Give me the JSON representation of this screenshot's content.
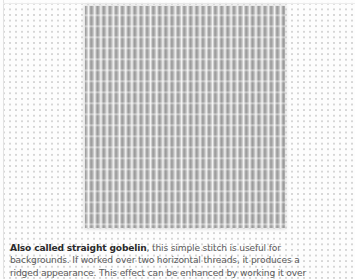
{
  "figure": {
    "colors": {
      "background": "#fdfdfd",
      "mesh_dots": "#d6d6d6",
      "stitch_grey": "#bcbcbc",
      "body_text": "#5a5a5a",
      "bold_text": "#2a2a2a"
    }
  },
  "caption": {
    "lead": "Also called straight gobelin",
    "line1_rest": ", this simple stitch is useful for",
    "line2": "backgrounds. If worked over two horizontal threads, it produces a",
    "line3": "ridged appearance. This effect can be enhanced by working it over"
  }
}
